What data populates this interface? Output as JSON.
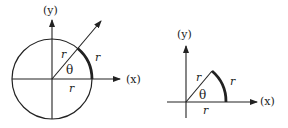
{
  "colors": {
    "stroke": "#222222",
    "background": "#ffffff"
  },
  "figures": [
    {
      "name": "full-circle-radian",
      "axis_labels": {
        "y": "(y)",
        "x": "(x)"
      },
      "radius_label_ray": "r",
      "radius_label_arc": "r",
      "radius_label_xaxis": "r",
      "angle_label": "θ"
    },
    {
      "name": "sector-radian",
      "axis_labels": {
        "y": "(y)",
        "x": "(x)"
      },
      "radius_label_ray": "r",
      "radius_label_arc": "r",
      "radius_label_xaxis": "r",
      "angle_label": "θ"
    }
  ]
}
